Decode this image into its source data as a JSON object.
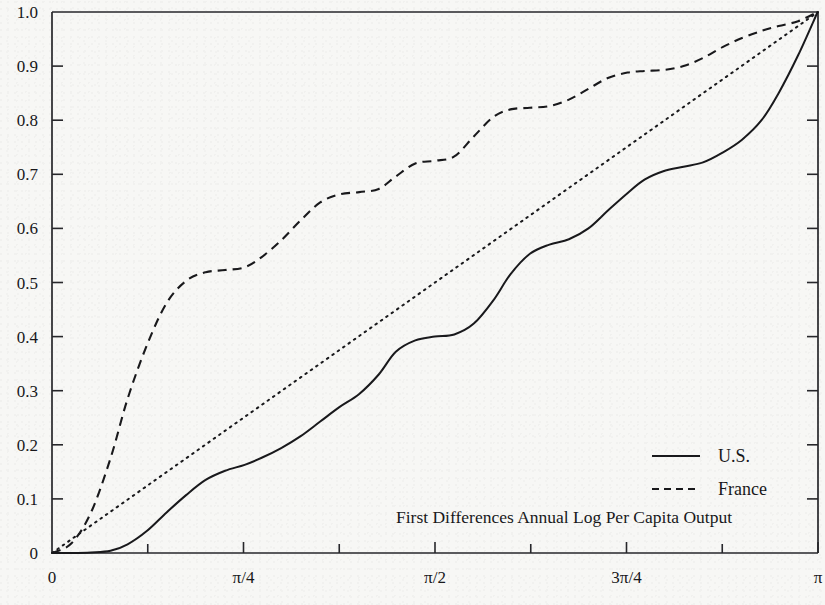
{
  "figure": {
    "caption": "First Differences Annual Log Per Capita Output",
    "background_color": "#f7f7f5",
    "ink_color": "#18181b"
  },
  "legend": {
    "position": "inside-lower-right",
    "entries": [
      {
        "label": "U.S.",
        "style": "solid",
        "swatch": "solid-line-icon"
      },
      {
        "label": "France",
        "style": "dashed",
        "swatch": "dashed-line-icon"
      }
    ]
  },
  "axes": {
    "y": {
      "min": 0,
      "max": 1.0,
      "tick_labels": [
        "1.0",
        "0.9",
        "0.8",
        "0.7",
        "0.6",
        "0.5",
        "0.4",
        "0.3",
        "0.2",
        "0.1",
        "0"
      ],
      "tick_values": [
        1.0,
        0.9,
        0.8,
        0.7,
        0.6,
        0.5,
        0.4,
        0.3,
        0.2,
        0.1,
        0.0
      ]
    },
    "x": {
      "min": 0,
      "max": 3.14159265,
      "labeled_ticks": [
        {
          "label": "0",
          "value": 0
        },
        {
          "label": "π/4",
          "value": 0.78539816
        },
        {
          "label": "π/2",
          "value": 1.57079633
        },
        {
          "label": "3π/4",
          "value": 2.35619449
        },
        {
          "label": "π",
          "value": 3.14159265
        }
      ],
      "minor_tick_values": [
        0.39269908,
        1.17809725,
        1.96349541,
        2.74889357
      ]
    }
  },
  "chart_data": {
    "type": "line",
    "title": "",
    "subtitle": "",
    "xlabel": "",
    "ylabel": "",
    "xlim": [
      0,
      3.14159265
    ],
    "ylim": [
      0,
      1.0
    ],
    "grid": false,
    "legend_position": "lower right inside",
    "annotations": [
      "First Differences Annual Log Per Capita Output"
    ],
    "series": [
      {
        "name": "U.S.",
        "style": "solid",
        "x": [
          0.0,
          0.08,
          0.16,
          0.24,
          0.31,
          0.39,
          0.47,
          0.55,
          0.63,
          0.71,
          0.79,
          0.86,
          0.94,
          1.02,
          1.1,
          1.18,
          1.26,
          1.34,
          1.41,
          1.49,
          1.57,
          1.65,
          1.73,
          1.81,
          1.88,
          1.96,
          2.04,
          2.12,
          2.2,
          2.28,
          2.36,
          2.43,
          2.51,
          2.59,
          2.67,
          2.75,
          2.83,
          2.91,
          2.98,
          3.06,
          3.14
        ],
        "y": [
          0.0,
          0.0,
          0.001,
          0.004,
          0.016,
          0.041,
          0.075,
          0.107,
          0.135,
          0.152,
          0.163,
          0.176,
          0.194,
          0.216,
          0.243,
          0.27,
          0.294,
          0.33,
          0.372,
          0.393,
          0.4,
          0.404,
          0.424,
          0.467,
          0.515,
          0.553,
          0.57,
          0.58,
          0.6,
          0.633,
          0.665,
          0.69,
          0.706,
          0.714,
          0.722,
          0.74,
          0.764,
          0.8,
          0.85,
          0.92,
          1.0
        ]
      },
      {
        "name": "France",
        "style": "dashed",
        "x": [
          0.0,
          0.08,
          0.16,
          0.24,
          0.31,
          0.39,
          0.47,
          0.55,
          0.63,
          0.71,
          0.79,
          0.86,
          0.94,
          1.02,
          1.1,
          1.18,
          1.26,
          1.34,
          1.41,
          1.49,
          1.57,
          1.65,
          1.73,
          1.81,
          1.88,
          1.96,
          2.04,
          2.12,
          2.2,
          2.28,
          2.36,
          2.43,
          2.51,
          2.59,
          2.67,
          2.75,
          2.83,
          2.91,
          2.98,
          3.06,
          3.14
        ],
        "y": [
          0.0,
          0.018,
          0.075,
          0.175,
          0.285,
          0.385,
          0.462,
          0.503,
          0.519,
          0.523,
          0.528,
          0.547,
          0.578,
          0.615,
          0.648,
          0.663,
          0.667,
          0.673,
          0.696,
          0.72,
          0.725,
          0.733,
          0.77,
          0.806,
          0.82,
          0.823,
          0.826,
          0.838,
          0.858,
          0.878,
          0.888,
          0.891,
          0.893,
          0.9,
          0.915,
          0.935,
          0.952,
          0.965,
          0.974,
          0.983,
          1.0
        ]
      },
      {
        "name": "45-degree reference",
        "style": "dotted",
        "x": [
          0.0,
          3.14159265
        ],
        "y": [
          0.0,
          1.0
        ]
      }
    ]
  }
}
